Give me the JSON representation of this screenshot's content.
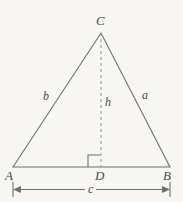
{
  "figure": {
    "background_color": "#f7f6f3",
    "stroke_color": "#6f6f6f",
    "label_color": "#4a4a4a",
    "vertices": {
      "A": {
        "label": "A",
        "x": 13,
        "y": 167
      },
      "B": {
        "label": "B",
        "x": 170,
        "y": 167
      },
      "C": {
        "label": "C",
        "x": 101,
        "y": 33
      },
      "D": {
        "label": "D",
        "x": 101,
        "y": 167
      }
    },
    "sides": {
      "a": {
        "label": "a",
        "description": "side-BC"
      },
      "b": {
        "label": "b",
        "description": "side-AC"
      },
      "c": {
        "label": "c",
        "description": "base-AB"
      },
      "h": {
        "label": "h",
        "description": "altitude-CD"
      }
    },
    "markers": {
      "right_angle": "right-angle-square-at-D",
      "dimension_line": "double-arrow-dimension-c"
    }
  }
}
